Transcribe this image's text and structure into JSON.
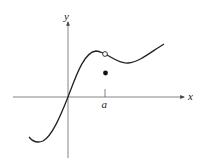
{
  "diagram": {
    "type": "function-graph",
    "axes": {
      "x_label": "x",
      "y_label": "y",
      "color": "#555555"
    },
    "tick": {
      "label": "a"
    },
    "curve": {
      "color": "#222222",
      "description": "Continuous curve through origin with removable discontinuity at x = a"
    },
    "points": {
      "open_circle": {
        "meaning": "hole in graph at x = a"
      },
      "filled_dot": {
        "meaning": "function value f(a), below the hole"
      }
    }
  }
}
